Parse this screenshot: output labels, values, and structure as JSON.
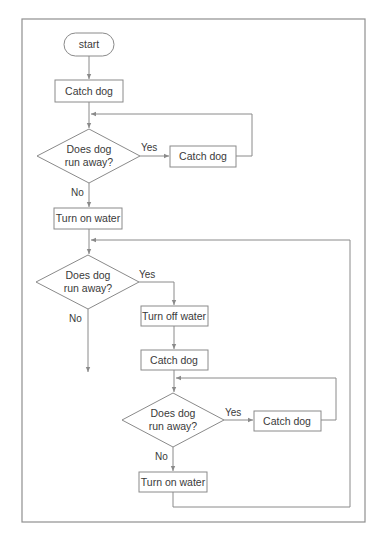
{
  "diagram": {
    "type": "flowchart",
    "nodes": {
      "start": {
        "label": "start",
        "shape": "terminator"
      },
      "catch1": {
        "label": "Catch dog",
        "shape": "process"
      },
      "decision1": {
        "label_line1": "Does dog",
        "label_line2": "run away?",
        "shape": "decision"
      },
      "catch2": {
        "label": "Catch dog",
        "shape": "process"
      },
      "water_on1": {
        "label": "Turn on water",
        "shape": "process"
      },
      "decision2": {
        "label_line1": "Does dog",
        "label_line2": "run away?",
        "shape": "decision"
      },
      "water_off": {
        "label": "Turn off water",
        "shape": "process"
      },
      "catch3": {
        "label": "Catch dog",
        "shape": "process"
      },
      "decision3": {
        "label_line1": "Does dog",
        "label_line2": "run away?",
        "shape": "decision"
      },
      "catch4": {
        "label": "Catch dog",
        "shape": "process"
      },
      "water_on2": {
        "label": "Turn on water",
        "shape": "process"
      }
    },
    "edge_labels": {
      "d1_yes": "Yes",
      "d1_no": "No",
      "d2_yes": "Yes",
      "d2_no": "No",
      "d3_yes": "Yes",
      "d3_no": "No"
    },
    "edges": [
      {
        "from": "start",
        "to": "catch1"
      },
      {
        "from": "catch1",
        "to": "decision1"
      },
      {
        "from": "decision1",
        "to": "catch2",
        "label": "Yes"
      },
      {
        "from": "catch2",
        "to": "decision1"
      },
      {
        "from": "decision1",
        "to": "water_on1",
        "label": "No"
      },
      {
        "from": "water_on1",
        "to": "decision2"
      },
      {
        "from": "decision2",
        "to": "water_off",
        "label": "Yes"
      },
      {
        "from": "decision2",
        "to": "exit",
        "label": "No"
      },
      {
        "from": "water_off",
        "to": "catch3"
      },
      {
        "from": "catch3",
        "to": "decision3"
      },
      {
        "from": "decision3",
        "to": "catch4",
        "label": "Yes"
      },
      {
        "from": "catch4",
        "to": "decision3"
      },
      {
        "from": "decision3",
        "to": "water_on2",
        "label": "No"
      },
      {
        "from": "water_on2",
        "to": "decision2"
      }
    ],
    "colors": {
      "line": "#8a8a8a",
      "text": "#3a3a3a",
      "background": "#ffffff"
    }
  }
}
